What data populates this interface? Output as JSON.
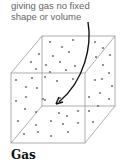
{
  "annotation": {
    "lines": [
      "giving gas no fixed",
      "shape or volume"
    ]
  },
  "diagram": {
    "title": "Gas",
    "shape": "cube-container",
    "particles": "gas-particles",
    "arrow": "curved-arrow-pointing-to-particles",
    "colors": {
      "edge": "#9a9a9a",
      "particle": "#777777",
      "arrow": "#111111",
      "text": "#666666"
    }
  }
}
